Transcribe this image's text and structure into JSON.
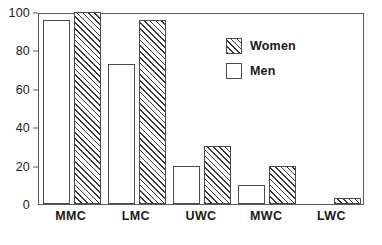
{
  "chart_data": {
    "type": "bar",
    "title": "",
    "subtitle": "",
    "xlabel": "",
    "ylabel": "",
    "categories": [
      "MMC",
      "LMC",
      "UWC",
      "MWC",
      "LWC"
    ],
    "series": [
      {
        "name": "Men",
        "values": [
          96,
          73,
          20,
          10,
          0
        ],
        "fill": "empty"
      },
      {
        "name": "Women",
        "values": [
          100,
          96,
          30,
          20,
          3
        ],
        "fill": "hatched"
      }
    ],
    "series_order_in_group": [
      "Men",
      "Women"
    ],
    "ylim": [
      0,
      100
    ],
    "yticks": [
      0,
      20,
      40,
      60,
      80,
      100
    ],
    "ytick_labels": [
      "0",
      "20",
      "40",
      "60",
      "80",
      "100"
    ],
    "grid": false,
    "legend_position": "top-right-inside",
    "legend_entries": [
      {
        "label": "Women",
        "pattern": "diagonal-hatch"
      },
      {
        "label": "Men",
        "pattern": "none"
      }
    ],
    "colors": {
      "axis": "#5a5a5a",
      "bar_outline": "#4a4a4a",
      "hatch": "#3a3a3a",
      "background": "#ffffff",
      "text": "#1a1a1a"
    }
  }
}
